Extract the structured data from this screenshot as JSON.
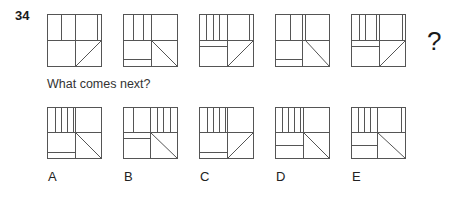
{
  "question": {
    "number": "34",
    "prompt": "What comes next?",
    "missing_marker": "?"
  },
  "sequence": [
    {
      "x": 47,
      "y": 14,
      "lines": [
        [
          14,
          0,
          14,
          26
        ],
        [
          28,
          0,
          28,
          52
        ],
        [
          50,
          0,
          50,
          26
        ],
        [
          0,
          26,
          54,
          26
        ],
        [
          28,
          52,
          54,
          26
        ]
      ]
    },
    {
      "x": 123,
      "y": 14,
      "lines": [
        [
          10,
          0,
          10,
          26
        ],
        [
          20,
          0,
          20,
          26
        ],
        [
          28,
          0,
          28,
          52
        ],
        [
          0,
          26,
          54,
          26
        ],
        [
          0,
          45,
          28,
          45
        ],
        [
          28,
          26,
          54,
          52
        ]
      ]
    },
    {
      "x": 199,
      "y": 14,
      "lines": [
        [
          7,
          0,
          7,
          26
        ],
        [
          14,
          0,
          14,
          26
        ],
        [
          20,
          0,
          20,
          26
        ],
        [
          28,
          0,
          28,
          52
        ],
        [
          50,
          0,
          50,
          26
        ],
        [
          0,
          26,
          54,
          26
        ],
        [
          0,
          32,
          28,
          32
        ],
        [
          28,
          52,
          54,
          26
        ]
      ]
    },
    {
      "x": 275,
      "y": 14,
      "lines": [
        [
          15,
          0,
          15,
          26
        ],
        [
          27,
          0,
          27,
          52
        ],
        [
          30,
          0,
          30,
          26
        ],
        [
          0,
          26,
          54,
          26
        ],
        [
          0,
          45,
          27,
          45
        ],
        [
          30,
          26,
          54,
          52
        ]
      ]
    },
    {
      "x": 351,
      "y": 14,
      "lines": [
        [
          8,
          0,
          8,
          26
        ],
        [
          14,
          0,
          14,
          26
        ],
        [
          25,
          0,
          25,
          26
        ],
        [
          28,
          0,
          28,
          52
        ],
        [
          51,
          0,
          51,
          26
        ],
        [
          0,
          26,
          54,
          26
        ],
        [
          0,
          32,
          28,
          32
        ],
        [
          28,
          52,
          54,
          26
        ]
      ]
    }
  ],
  "options": [
    {
      "label": "A",
      "x": 47,
      "y": 107,
      "lines": [
        [
          8,
          0,
          8,
          25
        ],
        [
          14,
          0,
          14,
          25
        ],
        [
          20,
          0,
          20,
          25
        ],
        [
          26,
          0,
          26,
          25
        ],
        [
          28,
          0,
          28,
          51
        ],
        [
          0,
          25,
          54,
          25
        ],
        [
          0,
          45,
          28,
          45
        ],
        [
          28,
          25,
          54,
          51
        ]
      ]
    },
    {
      "label": "B",
      "x": 123,
      "y": 107,
      "lines": [
        [
          10,
          0,
          10,
          25
        ],
        [
          27,
          0,
          27,
          51
        ],
        [
          34,
          0,
          34,
          25
        ],
        [
          40,
          0,
          40,
          25
        ],
        [
          47,
          0,
          47,
          25
        ],
        [
          0,
          25,
          54,
          25
        ],
        [
          0,
          31,
          27,
          31
        ],
        [
          27,
          25,
          54,
          51
        ]
      ]
    },
    {
      "label": "C",
      "x": 199,
      "y": 107,
      "lines": [
        [
          8,
          0,
          8,
          25
        ],
        [
          14,
          0,
          14,
          25
        ],
        [
          20,
          0,
          20,
          25
        ],
        [
          26,
          0,
          26,
          25
        ],
        [
          28,
          0,
          28,
          51
        ],
        [
          0,
          25,
          54,
          25
        ],
        [
          0,
          45,
          28,
          45
        ],
        [
          28,
          51,
          54,
          25
        ]
      ]
    },
    {
      "label": "D",
      "x": 275,
      "y": 107,
      "lines": [
        [
          7,
          0,
          7,
          25
        ],
        [
          13,
          0,
          13,
          25
        ],
        [
          19,
          0,
          19,
          25
        ],
        [
          25,
          0,
          25,
          25
        ],
        [
          28,
          0,
          28,
          51
        ],
        [
          0,
          25,
          54,
          25
        ],
        [
          0,
          38,
          28,
          38
        ],
        [
          28,
          25,
          54,
          51
        ]
      ]
    },
    {
      "label": "E",
      "x": 351,
      "y": 107,
      "lines": [
        [
          7,
          0,
          7,
          25
        ],
        [
          13,
          0,
          13,
          25
        ],
        [
          19,
          0,
          19,
          25
        ],
        [
          26,
          0,
          26,
          51
        ],
        [
          50,
          0,
          50,
          25
        ],
        [
          0,
          25,
          54,
          25
        ],
        [
          0,
          38,
          26,
          38
        ],
        [
          26,
          25,
          54,
          51
        ]
      ]
    }
  ],
  "box_size": 54
}
